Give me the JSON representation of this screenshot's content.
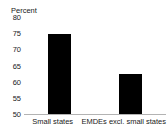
{
  "chart_data": {
    "type": "bar",
    "title": "",
    "subtitle": "",
    "unit_label": "Percent",
    "xlabel": "",
    "ylabel": "Percent",
    "categories": [
      "Small states",
      "EMDEs excl. small states"
    ],
    "values": [
      75.2,
      62.6
    ],
    "series": [
      {
        "name": "",
        "values": [
          75.2,
          62.6
        ]
      }
    ],
    "ylim": [
      50,
      80
    ],
    "yticks": [
      50,
      55,
      60,
      65,
      70,
      75,
      80
    ],
    "ytick_labels": [
      "50",
      "55",
      "60",
      "65",
      "70",
      "75",
      "80"
    ],
    "grid": false,
    "legend": false,
    "legend_position": "none",
    "bar_color": "#000000",
    "axis_color": "#b3b3b3",
    "text_color": "#1a1a1a",
    "annotations": []
  }
}
